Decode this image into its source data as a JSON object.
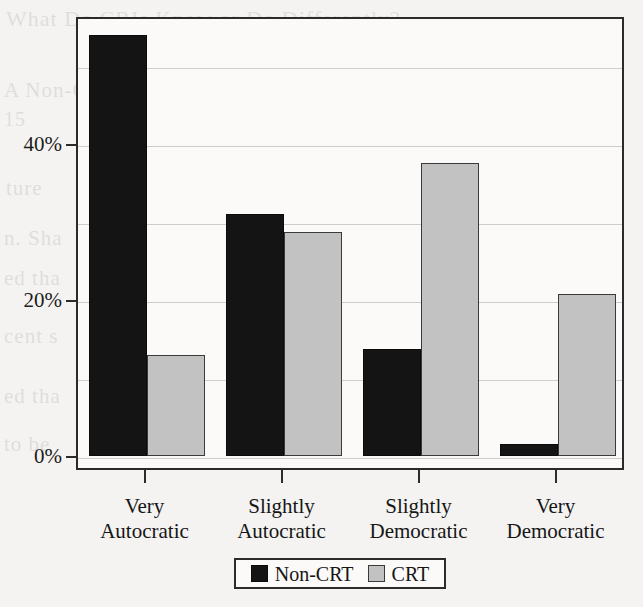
{
  "chart_data": {
    "type": "bar",
    "title": "",
    "subtitle": "",
    "xlabel": "",
    "ylabel": "",
    "categories": [
      "Very\nAutocratic",
      "Slightly\nAutocratic",
      "Slightly\nDemocratic",
      "Very\nDemocratic"
    ],
    "category_lines": [
      [
        "Very",
        "Autocratic"
      ],
      [
        "Slightly",
        "Autocratic"
      ],
      [
        "Slightly",
        "Democratic"
      ],
      [
        "Very",
        "Democratic"
      ]
    ],
    "series": [
      {
        "name": "Non-CRT",
        "color": "#141414",
        "values": [
          54,
          31,
          13.7,
          1.5
        ]
      },
      {
        "name": "CRT",
        "color": "#c2c2c2",
        "values": [
          13,
          28.7,
          37.6,
          20.8
        ]
      }
    ],
    "ylim": [
      0,
      58
    ],
    "yticks": [
      0,
      20,
      40
    ],
    "ytick_labels": [
      "0%",
      "20%",
      "40%"
    ],
    "grid": true,
    "grid_minor": [
      10,
      30,
      50
    ],
    "legend_position": "bottom",
    "legend_entries": [
      "Non-CRT",
      "CRT"
    ]
  },
  "bleed_text": [
    {
      "text": "What Do CRIs Know or Do Differently?",
      "x": 6,
      "y": 6,
      "size": 22
    },
    {
      "text": "A Non-CRT",
      "x": 4,
      "y": 78,
      "size": 21
    },
    {
      "text": "Models",
      "x": 170,
      "y": 78,
      "size": 21
    },
    {
      "text": "a book",
      "x": 560,
      "y": 72,
      "size": 21
    },
    {
      "text": "15",
      "x": 4,
      "y": 108,
      "size": 20
    },
    {
      "text": "Indiv",
      "x": 172,
      "y": 108,
      "size": 20
    },
    {
      "text": "ss an",
      "x": 566,
      "y": 104,
      "size": 20
    },
    {
      "text": "ture",
      "x": 6,
      "y": 176,
      "size": 21
    },
    {
      "text": "size",
      "x": 574,
      "y": 176,
      "size": 21
    },
    {
      "text": "n. Sha",
      "x": 4,
      "y": 226,
      "size": 21
    },
    {
      "text": "1 1989",
      "x": 190,
      "y": 226,
      "size": 21
    },
    {
      "text": "Crew",
      "x": 560,
      "y": 222,
      "size": 21
    },
    {
      "text": "ed tha",
      "x": 4,
      "y": 266,
      "size": 21
    },
    {
      "text": "naviou",
      "x": 188,
      "y": 262,
      "size": 21
    },
    {
      "text": "d CRT",
      "x": 556,
      "y": 262,
      "size": 21
    },
    {
      "text": "cent s",
      "x": 4,
      "y": 324,
      "size": 21
    },
    {
      "text": "n Lub",
      "x": 196,
      "y": 320,
      "size": 21
    },
    {
      "text": "(1998)",
      "x": 548,
      "y": 318,
      "size": 21
    },
    {
      "text": "ed tha",
      "x": 4,
      "y": 384,
      "size": 21
    },
    {
      "text": "Marit",
      "x": 196,
      "y": 380,
      "size": 21
    },
    {
      "text": "demy",
      "x": 552,
      "y": 378,
      "size": 21
    },
    {
      "text": "to be",
      "x": 4,
      "y": 432,
      "size": 21
    }
  ]
}
